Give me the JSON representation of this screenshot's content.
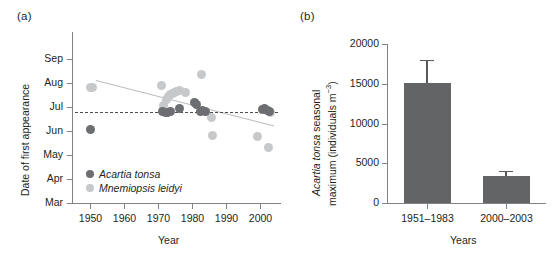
{
  "figure": {
    "panel_a_label": "(a)",
    "panel_b_label": "(b)"
  },
  "chart_data": [
    {
      "id": "panel-a",
      "type": "scatter",
      "title": "",
      "panel": "(a)",
      "xlabel": "Year",
      "ylabel": "Date of first appearance",
      "xlim": [
        1945,
        2006
      ],
      "ylim": [
        0,
        6
      ],
      "xticks": [
        1950,
        1960,
        1970,
        1980,
        1990,
        2000
      ],
      "yticks": [
        0,
        1,
        2,
        3,
        4,
        5,
        6
      ],
      "ytick_labels": [
        "Mar",
        "Apr",
        "May",
        "Jun",
        "Jul",
        "Aug",
        "Sep"
      ],
      "grid": false,
      "legend_position": "lower-left",
      "series": [
        {
          "name": "Acartia tonsa",
          "color": "#6d6e71",
          "marker": "circle",
          "points": [
            {
              "x": 1950.5,
              "y": 3.08
            },
            {
              "x": 1971.5,
              "y": 3.8
            },
            {
              "x": 1972.2,
              "y": 3.78
            },
            {
              "x": 1973.0,
              "y": 3.76
            },
            {
              "x": 1973.8,
              "y": 3.8
            },
            {
              "x": 1976.5,
              "y": 3.95
            },
            {
              "x": 1980.8,
              "y": 4.2
            },
            {
              "x": 1981.3,
              "y": 4.1
            },
            {
              "x": 1982.6,
              "y": 3.82
            },
            {
              "x": 1983.2,
              "y": 3.86
            },
            {
              "x": 1983.9,
              "y": 3.8
            },
            {
              "x": 2000.5,
              "y": 3.88
            },
            {
              "x": 2001.3,
              "y": 3.92
            },
            {
              "x": 2002.0,
              "y": 3.84
            },
            {
              "x": 2002.7,
              "y": 3.8
            }
          ]
        },
        {
          "name": "Mnemiopsis leidyi",
          "color": "#c7c8ca",
          "marker": "circle",
          "points": [
            {
              "x": 1950.3,
              "y": 4.82
            },
            {
              "x": 1951.1,
              "y": 4.8
            },
            {
              "x": 1971.0,
              "y": 4.9
            },
            {
              "x": 1971.8,
              "y": 4.05
            },
            {
              "x": 1972.6,
              "y": 4.3
            },
            {
              "x": 1973.2,
              "y": 4.45
            },
            {
              "x": 1973.8,
              "y": 4.52
            },
            {
              "x": 1974.4,
              "y": 4.58
            },
            {
              "x": 1975.0,
              "y": 4.62
            },
            {
              "x": 1975.6,
              "y": 4.66
            },
            {
              "x": 1976.3,
              "y": 4.7
            },
            {
              "x": 1978.0,
              "y": 4.62
            },
            {
              "x": 1982.7,
              "y": 5.35
            },
            {
              "x": 1985.6,
              "y": 3.55
            },
            {
              "x": 1986.0,
              "y": 2.82
            },
            {
              "x": 1999.2,
              "y": 2.78
            },
            {
              "x": 2002.4,
              "y": 2.3
            },
            {
              "x": 2003.0,
              "y": 3.76
            }
          ]
        }
      ],
      "annotations": [
        {
          "kind": "trendline",
          "series": "Mnemiopsis leidyi",
          "x0": 1952,
          "y0": 5.12,
          "x1": 2004,
          "y1": 3.22,
          "color": "#bcbec0",
          "style": "solid"
        },
        {
          "kind": "trendline",
          "series": "Acartia tonsa",
          "x0": 1946,
          "y0": 3.8,
          "x1": 2005,
          "y1": 3.8,
          "color": "#4d4d4f",
          "style": "dashed"
        }
      ],
      "legend": [
        {
          "label": "Acartia tonsa",
          "color": "#6d6e71"
        },
        {
          "label": "Mnemiopsis leidyi",
          "color": "#c7c8ca"
        }
      ]
    },
    {
      "id": "panel-b",
      "type": "bar",
      "panel": "(b)",
      "title": "",
      "xlabel": "Years",
      "ylabel": "Acartia tonsa seasonal maximum (individuals m−3)",
      "ylabel_italic_part": "Acartia tonsa",
      "ylabel_rest": " seasonal",
      "ylabel_line2_pre": "maximum (individuals m",
      "ylabel_line2_sup": "−3",
      "ylabel_line2_post": ")",
      "categories": [
        "1951–1983",
        "2000–2003"
      ],
      "values": [
        15100,
        3350
      ],
      "errors": [
        2900,
        700
      ],
      "bar_color": "#636466",
      "error_color": "#58595b",
      "ylim": [
        0,
        20000
      ],
      "yticks": [
        0,
        5000,
        10000,
        15000,
        20000
      ],
      "ytick_labels": [
        "0",
        "5000",
        "10000",
        "15000",
        "20000"
      ],
      "grid": false,
      "legend_position": "none"
    }
  ]
}
